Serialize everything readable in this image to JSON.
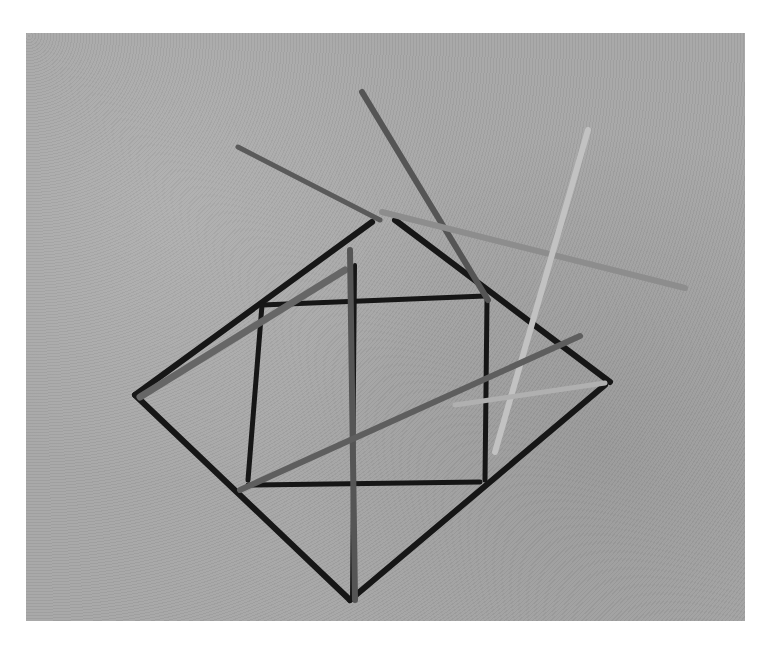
{
  "image": {
    "subject": "sticks arranged on sand forming a diamond and square shape",
    "style": "black and white photograph",
    "colors": {
      "sand": "#a9a9a9",
      "shadow": "#1a1a1a",
      "stick": "#6e6e6e",
      "stick_light": "#b8b8b8",
      "border": "#ffffff"
    }
  }
}
